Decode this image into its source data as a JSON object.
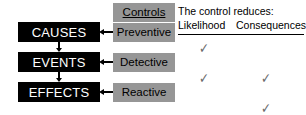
{
  "diagram": {
    "colors": {
      "chain_box_fill": "#000000",
      "chain_box_text": "#ffffff",
      "control_box_fill": "#969696",
      "control_box_text": "#000000",
      "arrow": "#000000",
      "check_mark": "#6b6b6b",
      "background": "#ffffff"
    },
    "chain": [
      {
        "id": "causes",
        "label": "CAUSES"
      },
      {
        "id": "events",
        "label": "EVENTS"
      },
      {
        "id": "effects",
        "label": "EFFECTS"
      }
    ],
    "controls_header": "Controls",
    "controls": [
      {
        "id": "preventive",
        "label": "Preventive"
      },
      {
        "id": "detective",
        "label": "Detective"
      },
      {
        "id": "reactive",
        "label": "Reactive"
      }
    ],
    "matrix": {
      "caption": "The control reduces:",
      "columns": [
        "Likelihood",
        "Consequences"
      ],
      "check_glyph": "✓",
      "rows": [
        {
          "control": "Preventive",
          "likelihood": true,
          "consequences": false
        },
        {
          "control": "Detective",
          "likelihood": true,
          "consequences": true
        },
        {
          "control": "Reactive",
          "likelihood": false,
          "consequences": true
        }
      ]
    }
  }
}
